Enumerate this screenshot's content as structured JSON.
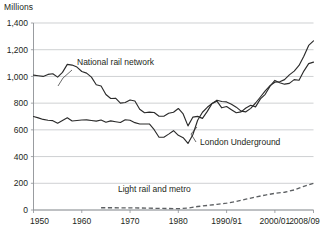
{
  "chart_data": {
    "type": "line",
    "title": "",
    "unit_label": "Millions",
    "xlabel": "",
    "ylabel": "Millions",
    "ylim": [
      0,
      1400
    ],
    "xlim": [
      1950,
      2008
    ],
    "grid": true,
    "legend_position": "inline-annotations",
    "ytick_labels": [
      "0",
      "200",
      "400",
      "600",
      "800",
      "1,000",
      "1,200",
      "1,400"
    ],
    "ytick_values": [
      0,
      200,
      400,
      600,
      800,
      1000,
      1200,
      1400
    ],
    "xtick_labels": [
      "1950",
      "1960",
      "1970",
      "1980",
      "1990/91",
      "2000/01",
      "2008/09"
    ],
    "xtick_values": [
      1950,
      1960,
      1970,
      1980,
      1990,
      2000,
      2008
    ],
    "series": [
      {
        "name": "National rail network",
        "style": "solid",
        "color": "#2b2b2b",
        "x": [
          1950,
          1951,
          1952,
          1953,
          1954,
          1955,
          1956,
          1957,
          1958,
          1959,
          1960,
          1961,
          1962,
          1963,
          1964,
          1965,
          1966,
          1967,
          1968,
          1969,
          1970,
          1971,
          1972,
          1973,
          1974,
          1975,
          1976,
          1977,
          1978,
          1979,
          1980,
          1981,
          1982,
          1983,
          1984,
          1985,
          1986,
          1987,
          1988,
          1989,
          1990,
          1991,
          1992,
          1993,
          1994,
          1995,
          1996,
          1997,
          1998,
          1999,
          2000,
          2001,
          2002,
          2003,
          2004,
          2005,
          2006,
          2007,
          2008
        ],
        "values": [
          1010,
          1005,
          1000,
          1015,
          1020,
          995,
          1030,
          1090,
          1085,
          1070,
          1037,
          1025,
          995,
          938,
          928,
          865,
          835,
          837,
          800,
          805,
          824,
          816,
          754,
          728,
          733,
          730,
          702,
          702,
          724,
          732,
          760,
          719,
          630,
          695,
          701,
          686,
          738,
          798,
          822,
          812,
          809,
          792,
          770,
          740,
          735,
          761,
          801,
          846,
          892,
          931,
          957,
          960,
          976,
          1012,
          1040,
          1082,
          1151,
          1232,
          1266
        ]
      },
      {
        "name": "London Underground",
        "style": "solid",
        "color": "#2b2b2b",
        "x": [
          1950,
          1951,
          1952,
          1953,
          1954,
          1955,
          1956,
          1957,
          1958,
          1959,
          1960,
          1961,
          1962,
          1963,
          1964,
          1965,
          1966,
          1967,
          1968,
          1969,
          1970,
          1971,
          1972,
          1973,
          1974,
          1975,
          1976,
          1977,
          1978,
          1979,
          1980,
          1981,
          1982,
          1983,
          1984,
          1985,
          1986,
          1987,
          1988,
          1989,
          1990,
          1991,
          1992,
          1993,
          1994,
          1995,
          1996,
          1997,
          1998,
          1999,
          2000,
          2001,
          2002,
          2003,
          2004,
          2005,
          2006,
          2007,
          2008
        ],
        "values": [
          700,
          690,
          678,
          672,
          669,
          650,
          670,
          690,
          666,
          670,
          674,
          675,
          670,
          665,
          674,
          657,
          667,
          661,
          655,
          676,
          672,
          654,
          644,
          644,
          644,
          601,
          545,
          545,
          568,
          594,
          559,
          541,
          498,
          563,
          672,
          732,
          769,
          798,
          815,
          765,
          775,
          751,
          728,
          735,
          764,
          784,
          772,
          832,
          866,
          927,
          970,
          953,
          942,
          948,
          976,
          971,
          1040,
          1096,
          1107
        ]
      },
      {
        "name": "Light rail and metro",
        "style": "dashed",
        "color": "#5d6063",
        "x": [
          1964,
          1966,
          1968,
          1970,
          1972,
          1974,
          1976,
          1978,
          1980,
          1982,
          1984,
          1986,
          1988,
          1990,
          1992,
          1994,
          1996,
          1998,
          2000,
          2002,
          2004,
          2006,
          2008
        ],
        "values": [
          17,
          17,
          16,
          16,
          15,
          14,
          12,
          11,
          10,
          14,
          26,
          34,
          42,
          51,
          64,
          81,
          97,
          112,
          125,
          133,
          150,
          177,
          199
        ]
      }
    ],
    "annotations": [
      {
        "text": "National rail network",
        "x_px": 77,
        "y_px": 65
      },
      {
        "text": "London Underground",
        "x_px": 200,
        "y_px": 145
      },
      {
        "text": "Light rail and metro",
        "x_px": 118,
        "y_px": 192
      }
    ]
  }
}
